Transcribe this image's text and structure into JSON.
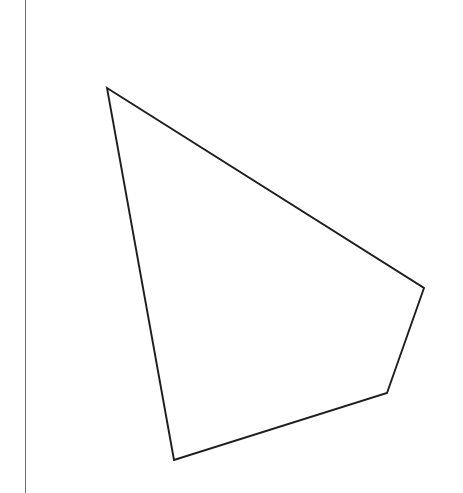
{
  "canvas": {
    "width": 463,
    "height": 493,
    "background_color": "#ffffff",
    "description": "Blank white worksheet area with a vertical ruled margin line and a hand-drawn quadrilateral outline"
  },
  "margin_rule": {
    "name": "vertical-margin-line",
    "orientation": "vertical",
    "x": 25.5,
    "y_start": 0,
    "y_end": 493,
    "color": "#6e6e6e",
    "stroke_width": 1.6
  },
  "shape": {
    "name": "quadrilateral",
    "type": "polygon",
    "sides": 4,
    "fill": "none",
    "stroke_color": "#1d1d1d",
    "stroke_width": 1.9,
    "points_attr": "107,88 424,288 387,393 174,460",
    "vertices": [
      {
        "label": "top-left-vertex",
        "x": 107,
        "y": 88
      },
      {
        "label": "right-vertex",
        "x": 424,
        "y": 288
      },
      {
        "label": "lower-right-vertex",
        "x": 387,
        "y": 393
      },
      {
        "label": "bottom-left-vertex",
        "x": 174,
        "y": 460
      }
    ],
    "edges": [
      {
        "label": "top-edge",
        "from": "top-left-vertex",
        "to": "right-vertex"
      },
      {
        "label": "right-edge",
        "from": "right-vertex",
        "to": "lower-right-vertex"
      },
      {
        "label": "bottom-edge",
        "from": "lower-right-vertex",
        "to": "bottom-left-vertex"
      },
      {
        "label": "left-edge",
        "from": "bottom-left-vertex",
        "to": "top-left-vertex"
      }
    ]
  }
}
